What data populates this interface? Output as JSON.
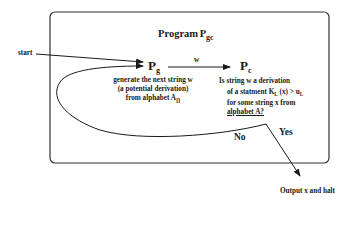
{
  "diagram": {
    "title": "Program",
    "title_sub": "gc",
    "start_label": "start",
    "edge_label_w": "w",
    "node_pg": {
      "main": "P",
      "sub": "g"
    },
    "node_pc": {
      "main": "P",
      "sub": "c"
    },
    "pg_desc": {
      "line1": "generate the next string w",
      "line2": "(a potential derivation)",
      "line3_prefix": "from alphabet A",
      "line3_sub": "∏"
    },
    "pc_desc": {
      "line1": "Is string w a derivation",
      "line2_a": "of a statment K",
      "line2_sub1": "L",
      "line2_b": " (x) > u",
      "line2_sub2": "L",
      "line3": "for some string x from",
      "line4": "alphabet A?"
    },
    "no_label": "No",
    "yes_label": "Yes",
    "output_label": "Output x and halt"
  }
}
